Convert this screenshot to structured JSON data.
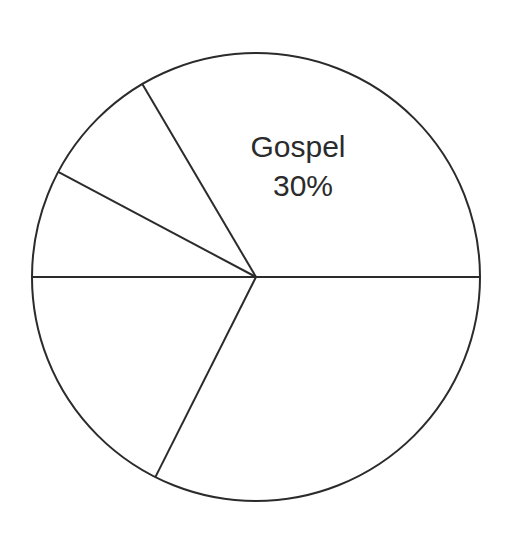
{
  "page": {
    "background_color": "#ffffff",
    "width": 510,
    "height": 537
  },
  "chart_data": {
    "type": "pie",
    "title": "",
    "subtitle": "",
    "xlabel": "",
    "ylabel": "",
    "grid": false,
    "legend_position": "none",
    "style": {
      "fill_color": "#ffffff",
      "stroke_color": "#2b2b2b",
      "stroke_width": 2,
      "label_color": "#2b2b2b",
      "label_font_size": 30
    },
    "geometry": {
      "center_x": 256,
      "center_y": 277,
      "radius": 224,
      "start_angle_deg": 0,
      "direction": "counterclockwise"
    },
    "categories": [
      "Gospel",
      "",
      "",
      "",
      ""
    ],
    "values": [
      30,
      8.8,
      7.8,
      17.6,
      35.8
    ],
    "slices": [
      {
        "name": "Gospel",
        "label": "Gospel",
        "value_label": "30%",
        "value": 30,
        "labeled": true,
        "start_angle_deg": 0,
        "end_angle_deg": 120.5,
        "label_x": 298,
        "label_y": 157,
        "value_label_x": 303,
        "value_label_y": 196
      },
      {
        "name": "slice-2",
        "label": "",
        "value_label": "",
        "value": 8.8,
        "labeled": false,
        "start_angle_deg": 120.5,
        "end_angle_deg": 152.0
      },
      {
        "name": "slice-3",
        "label": "",
        "value_label": "",
        "value": 7.8,
        "labeled": false,
        "start_angle_deg": 152.0,
        "end_angle_deg": 180.0
      },
      {
        "name": "slice-4",
        "label": "",
        "value_label": "",
        "value": 17.6,
        "labeled": false,
        "start_angle_deg": 180.0,
        "end_angle_deg": 243.3
      },
      {
        "name": "slice-5",
        "label": "",
        "value_label": "",
        "value": 35.8,
        "labeled": false,
        "start_angle_deg": 243.3,
        "end_angle_deg": 360.0
      }
    ],
    "annotations": [
      {
        "text": "Gospel",
        "x": 298,
        "y": 157
      },
      {
        "text": "30%",
        "x": 303,
        "y": 196
      }
    ]
  }
}
